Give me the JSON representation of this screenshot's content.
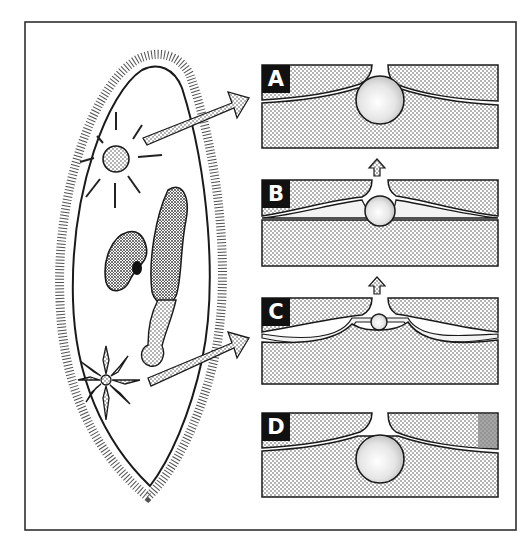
{
  "figure": {
    "frame": {
      "x": 25,
      "y": 22,
      "width": 491,
      "height": 508
    },
    "colors": {
      "ink": "#1a1a1a",
      "stipple": "#cfcfcf",
      "stipple_dark": "#9a9a9a",
      "background": "#ffffff",
      "label_bg": "#111111",
      "label_fg": "#ffffff"
    }
  },
  "panels": [
    {
      "label": "A",
      "stage": "vacuole fully open, pore open",
      "top": 65
    },
    {
      "label": "B",
      "stage": "vacuole partially emptied",
      "top": 180
    },
    {
      "label": "C",
      "stage": "vacuole nearly emptied, feeder canals filling",
      "top": 298
    },
    {
      "label": "D",
      "stage": "vacuole refilled from canals",
      "top": 413
    }
  ],
  "arrows": {
    "cell_to_panel_A": "upper vacuole to panel A",
    "cell_to_panel_C": "lower vacuole to panel C",
    "between_panels": [
      "B to A",
      "C to B"
    ]
  }
}
